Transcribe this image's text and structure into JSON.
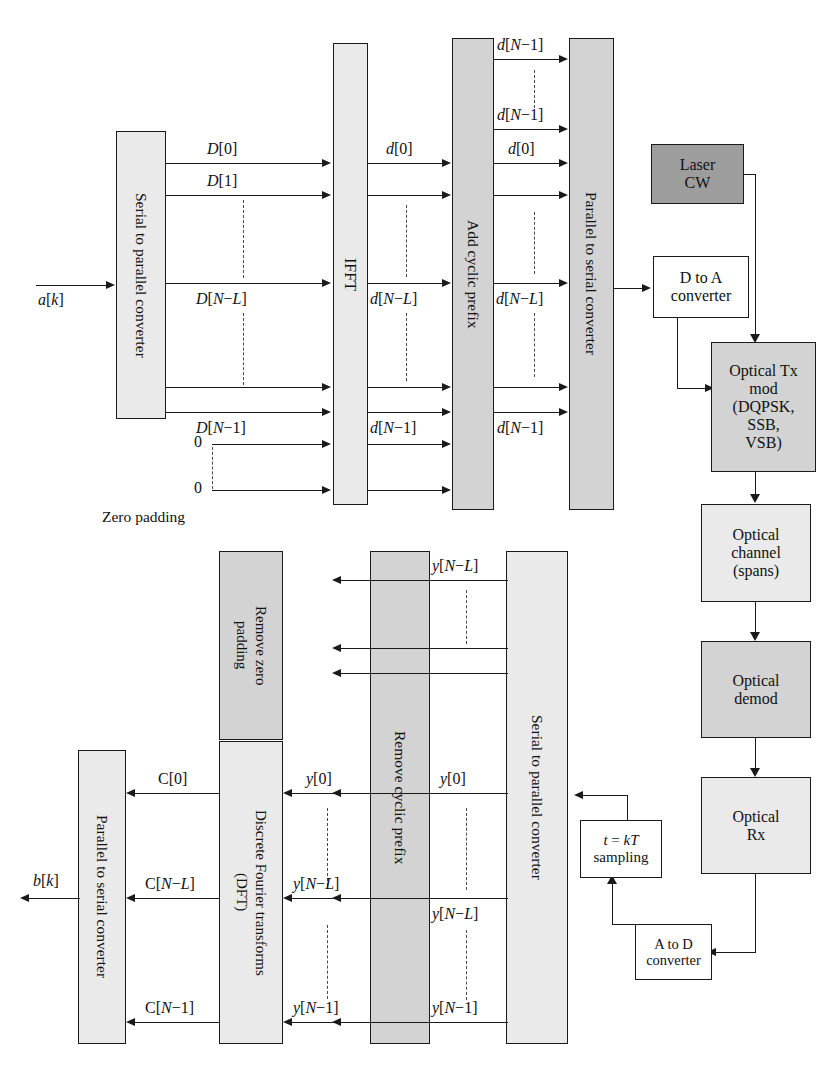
{
  "diagram": {
    "colors": {
      "light_block": "#eaeaea",
      "mid_block": "#d3d3d3",
      "dark_block": "#9d9d9d",
      "white_block": "#ffffff",
      "line": "#1a1a1a"
    }
  },
  "transmitter": {
    "serial_to_parallel": "Serial to parallel converter",
    "ifft": "IFFT",
    "add_cyclic_prefix": "Add cyclic prefix",
    "parallel_to_serial": "Parallel to serial converter",
    "input_label": "a[k]",
    "zero_padding_caption": "Zero padding",
    "zero_top": "0",
    "zero_bottom": "0",
    "d_cap_labels": [
      "D[0]",
      "D[1]",
      "D[N−L]",
      "D[N−1]"
    ],
    "d_small_labels_ifft_out": [
      "d[0]",
      "d[N−L]",
      "d[N−1]"
    ],
    "d_small_labels_cp_out": [
      "d[N−1]",
      "d[N−1]",
      "d[0]",
      "d[N−L]",
      "d[N−1]"
    ]
  },
  "optical_chain": {
    "laser": "Laser\nCW",
    "laser_line1": "Laser",
    "laser_line2": "CW",
    "dac_line1": "D to A",
    "dac_line2": "converter",
    "tx_mod_line1": "Optical Tx",
    "tx_mod_line2": "mod",
    "tx_mod_line3": "(DQPSK,",
    "tx_mod_line4": "SSB,",
    "tx_mod_line5": "VSB)",
    "channel_line1": "Optical",
    "channel_line2": "channel",
    "channel_line3": "(spans)",
    "demod_line1": "Optical",
    "demod_line2": "demod",
    "rx_line1": "Optical",
    "rx_line2": "Rx",
    "adc_line1": "A to D",
    "adc_line2": "converter",
    "sampling_line1": "t = kT",
    "sampling_line2": "sampling"
  },
  "receiver": {
    "serial_to_parallel": "Serial to parallel converter",
    "remove_cyclic_prefix": "Remove cyclic prefix",
    "remove_zero_padding_line1": "Remove zero",
    "remove_zero_padding_line2": "padding",
    "dft_line1": "Discrete Fourier transforms",
    "dft_line2": "(DFT)",
    "parallel_to_serial": "Parallel to serial converter",
    "output_label": "b[k]",
    "y_labels_s2p_out": [
      "y[N−L]",
      "y[0]",
      "y[N−L]",
      "y[N−1]"
    ],
    "y_labels_rcp_out": [
      "y[0]",
      "y[N−L]",
      "y[N−1]"
    ],
    "c_labels": [
      "C[0]",
      "C[N−L]",
      "C[N−1]"
    ]
  }
}
